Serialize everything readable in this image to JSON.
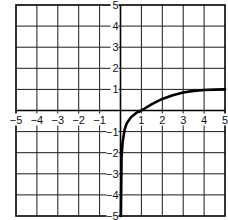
{
  "chart_data": {
    "type": "line",
    "title": "",
    "xlabel": "",
    "ylabel": "",
    "xlim": [
      -5,
      5
    ],
    "ylim": [
      -5,
      5
    ],
    "grid": true,
    "legend": null,
    "x_ticks": [
      "−5",
      "−4",
      "−3",
      "−2",
      "−1",
      "1",
      "2",
      "3",
      "4",
      "5"
    ],
    "y_ticks": [
      "5",
      "4",
      "3",
      "2",
      "1",
      "−1",
      "−2",
      "−3",
      "−4",
      "−5"
    ],
    "series": [
      {
        "name": "curve",
        "x": [
          0.02,
          0.05,
          0.1,
          0.2,
          0.3,
          0.5,
          0.75,
          1,
          1.5,
          2,
          2.5,
          3,
          3.5,
          4,
          4.5,
          5
        ],
        "y": [
          -5,
          -2.2,
          -1.5,
          -0.9,
          -0.6,
          -0.32,
          -0.12,
          0,
          0.3,
          0.55,
          0.72,
          0.85,
          0.93,
          0.97,
          0.99,
          1.0
        ]
      }
    ]
  },
  "colors": {
    "curve": "#000000",
    "grid": "#1a1a1a",
    "background": "#ffffff"
  }
}
